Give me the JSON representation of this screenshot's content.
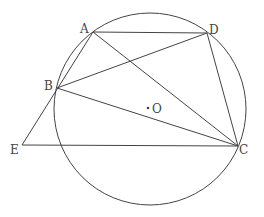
{
  "diagram": {
    "type": "geometry",
    "circle": {
      "center_label": "O",
      "passes_through": [
        "A",
        "B",
        "C",
        "D"
      ]
    },
    "points": [
      {
        "id": "A",
        "label": "A"
      },
      {
        "id": "B",
        "label": "B"
      },
      {
        "id": "C",
        "label": "C"
      },
      {
        "id": "D",
        "label": "D"
      },
      {
        "id": "E",
        "label": "E"
      },
      {
        "id": "O",
        "label": "O"
      }
    ],
    "segments": [
      [
        "A",
        "D"
      ],
      [
        "A",
        "C"
      ],
      [
        "A",
        "E"
      ],
      [
        "B",
        "D"
      ],
      [
        "B",
        "C"
      ],
      [
        "D",
        "C"
      ],
      [
        "E",
        "C"
      ]
    ],
    "center_marker": "·"
  }
}
